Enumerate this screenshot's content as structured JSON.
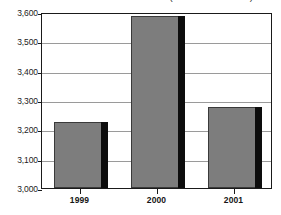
{
  "chart_data": {
    "type": "bar",
    "title": "(millions of dollars)",
    "subtitle": "",
    "xlabel": "",
    "ylabel": "",
    "categories": [
      "1999",
      "2000",
      "2001"
    ],
    "values": [
      3225,
      3585,
      3275
    ],
    "series": [
      {
        "name": "",
        "values": [
          3225,
          3585,
          3275
        ]
      }
    ],
    "ylim": [
      3000,
      3600
    ],
    "yticks": [
      3000,
      3100,
      3200,
      3300,
      3400,
      3500,
      3600
    ],
    "ytick_labels": [
      "3,000",
      "3,100",
      "3,200",
      "3,300",
      "3,400",
      "3,500",
      "3,600"
    ],
    "grid": true,
    "grid_axis": "y",
    "legend": false,
    "legend_position": "none",
    "bar_color": "#7d7d7d",
    "bar_shadow_color": "#0d0d0d",
    "bar_edge_color": "#3a3a3a",
    "gridline_color": "#9a9a9a",
    "frame_color": "#1a1a1a",
    "background_color": "#ffffff",
    "annotations": []
  }
}
